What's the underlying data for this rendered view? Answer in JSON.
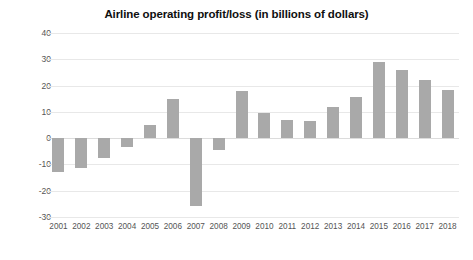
{
  "chart_data": {
    "type": "bar",
    "title": "Airline operating profit/loss (in billions of dollars)",
    "xlabel": "",
    "ylabel": "",
    "ylim": [
      -30,
      40
    ],
    "yticks": [
      40,
      30,
      20,
      10,
      0,
      -10,
      -20,
      -30
    ],
    "ytick_labels": [
      "40",
      "30",
      "20",
      "10",
      "0",
      "-10",
      "-20",
      "-30"
    ],
    "grid": true,
    "legend": false,
    "bar_color": "#a9a9a9",
    "categories": [
      "2001",
      "2002",
      "2003",
      "2004",
      "2005",
      "2006",
      "2007",
      "2008",
      "2009",
      "2010",
      "2011",
      "2012",
      "2013",
      "2014",
      "2015",
      "2016",
      "2017",
      "2018"
    ],
    "values": [
      -13,
      -11.5,
      -7.5,
      -3.5,
      5,
      15,
      -26,
      -4.5,
      18,
      9.5,
      7,
      6.5,
      12,
      15.5,
      29,
      26,
      22,
      18.5
    ]
  }
}
